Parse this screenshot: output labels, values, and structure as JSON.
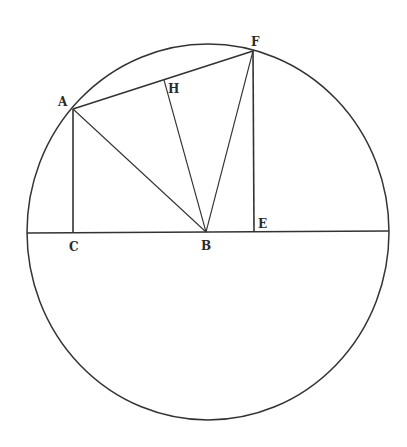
{
  "diagram": {
    "type": "geometry-circle-construction",
    "stroke_color": "#333333",
    "background": "#ffffff",
    "circle": {
      "cx": 208,
      "cy": 232,
      "rx": 181,
      "ry": 188
    },
    "points": {
      "A": {
        "x": 73,
        "y": 109
      },
      "B": {
        "x": 206,
        "y": 232
      },
      "C": {
        "x": 73,
        "y": 233
      },
      "E": {
        "x": 254,
        "y": 232
      },
      "F": {
        "x": 253,
        "y": 51
      },
      "H": {
        "x": 164,
        "y": 80
      }
    },
    "labels": [
      {
        "id": "A",
        "text": "A",
        "x": 58,
        "y": 96
      },
      {
        "id": "F",
        "text": "F",
        "x": 251,
        "y": 36
      },
      {
        "id": "H",
        "text": "H",
        "x": 168,
        "y": 83
      },
      {
        "id": "C",
        "text": "C",
        "x": 69,
        "y": 241
      },
      {
        "id": "B",
        "text": "B",
        "x": 201,
        "y": 240
      },
      {
        "id": "E",
        "text": "E",
        "x": 258,
        "y": 218
      }
    ],
    "segments": [
      {
        "from": "A",
        "to": "F",
        "width": 1.6
      },
      {
        "from": "A",
        "to": "C",
        "width": 1.6
      },
      {
        "from": "A",
        "to": "B",
        "width": 1.1
      },
      {
        "from": "H",
        "to": "B",
        "width": 1.1
      },
      {
        "from": "F",
        "to": "B",
        "width": 1.1
      },
      {
        "from": "F",
        "to": "E",
        "width": 1.6
      },
      {
        "from": "diameter-left",
        "to": "diameter-right",
        "width": 1.6
      }
    ],
    "diameter": {
      "x1": 27,
      "y1": 233,
      "x2": 389,
      "y2": 231
    }
  }
}
